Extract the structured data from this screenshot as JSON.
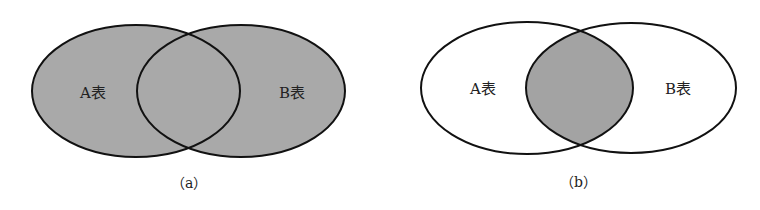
{
  "figure_a": {
    "caption": "（a）",
    "left_label": "A表",
    "right_label": "B表",
    "shaded": "union"
  },
  "figure_b": {
    "caption": "（b）",
    "left_label": "A表",
    "right_label": "B表",
    "shaded": "intersection"
  },
  "colors": {
    "fill": "#a9a9a9",
    "stroke": "#111111",
    "background": "#ffffff"
  }
}
